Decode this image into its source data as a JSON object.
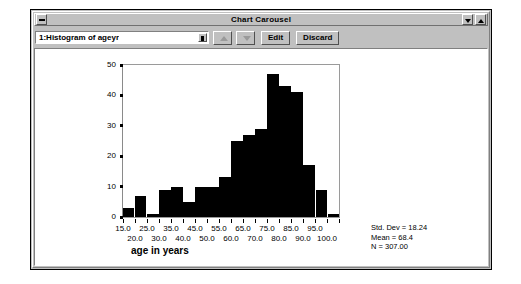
{
  "window": {
    "title": "Chart Carousel",
    "system_menu_icon": "minimize-box-icon",
    "minimize_icon": "chevron-down-icon",
    "maximize_icon": "chevron-up-icon"
  },
  "toolbar": {
    "combo_value": "1:Histogram of ageyr",
    "combo_arrow_icon": "spin-arrow-icon",
    "spin_up_icon": "triangle-up-icon",
    "spin_down_icon": "triangle-down-icon",
    "edit_label": "Edit",
    "discard_label": "Discard"
  },
  "chart_data": {
    "type": "bar",
    "title": "",
    "subtitle": "",
    "xlabel": "age in years",
    "ylabel": "",
    "ylim": [
      0,
      50
    ],
    "yticks": [
      0,
      10,
      20,
      30,
      40,
      50
    ],
    "ytick_labels": [
      "0",
      "10",
      "20",
      "30",
      "40",
      "50"
    ],
    "xlim": [
      15.0,
      105.0
    ],
    "xtick_labels_row1": [
      "15.0",
      "25.0",
      "35.0",
      "45.0",
      "55.0",
      "65.0",
      "75.0",
      "85.0",
      "95.0"
    ],
    "xtick_labels_row2": [
      "20.0",
      "30.0",
      "40.0",
      "50.0",
      "60.0",
      "70.0",
      "80.0",
      "90.0",
      "100.0"
    ],
    "grid": false,
    "legend": "none",
    "bar_color": "#000000",
    "categories": [
      "15-20",
      "20-25",
      "25-30",
      "30-35",
      "35-40",
      "40-45",
      "45-50",
      "50-55",
      "55-60",
      "60-65",
      "65-70",
      "70-75",
      "75-80",
      "80-85",
      "85-90",
      "90-95",
      "95-100",
      "100-105"
    ],
    "values": [
      3,
      7,
      1,
      9,
      10,
      5,
      10,
      10,
      13,
      25,
      27,
      29,
      47,
      43,
      41,
      17,
      9,
      1
    ],
    "annotations": {
      "std_dev": "Std. Dev = 18.24",
      "mean": "Mean = 68.4",
      "n": "N = 307.00"
    }
  }
}
